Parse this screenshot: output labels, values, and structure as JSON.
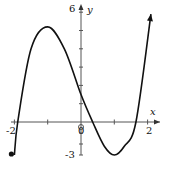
{
  "chart_data": {
    "type": "line",
    "title": "",
    "xlabel": "x",
    "ylabel": "y",
    "xlim": [
      -2,
      2
    ],
    "ylim": [
      -3,
      6
    ],
    "x_tick_labels": [
      "-2",
      "0",
      "2"
    ],
    "y_tick_labels": [
      "6",
      "-3"
    ],
    "origin_label": "0",
    "grid": false,
    "series": [
      {
        "name": "f(x)",
        "start_point": {
          "x": -2,
          "y": -3,
          "style": "closed-dot"
        },
        "end": "arrow",
        "x": [
          -2,
          -1.9,
          -1.5,
          -1,
          -0.5,
          0,
          0.35,
          0.7,
          1,
          1.3,
          1.65,
          2.1
        ],
        "y": [
          -3,
          0,
          4,
          5.2,
          4,
          1.5,
          0,
          -2.2,
          -3,
          -2.2,
          0,
          5.9
        ]
      }
    ],
    "key_points": {
      "local_max": {
        "x": -1,
        "y": 5.2
      },
      "local_min": {
        "x": 1,
        "y": -3
      },
      "y_intercept": 1.5,
      "x_intercepts": [
        -1.9,
        0.35,
        1.65
      ]
    }
  }
}
